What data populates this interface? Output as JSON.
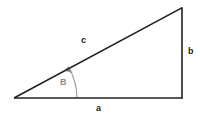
{
  "figure": {
    "kind": "right-triangle-geometry-diagram",
    "background_color": "#ffffff",
    "stroke_color": "#231f20",
    "accent_color": "#8c8c8c"
  },
  "labels": {
    "hypotenuse": "c",
    "vertical_side": "b",
    "horizontal_side": "a",
    "angle": "B"
  },
  "geometry": {
    "vertex_left": {
      "x": 14,
      "y": 98
    },
    "vertex_bottom_right": {
      "x": 182,
      "y": 98
    },
    "vertex_top_right": {
      "x": 182,
      "y": 8
    },
    "angle_arc_radius": 63
  }
}
